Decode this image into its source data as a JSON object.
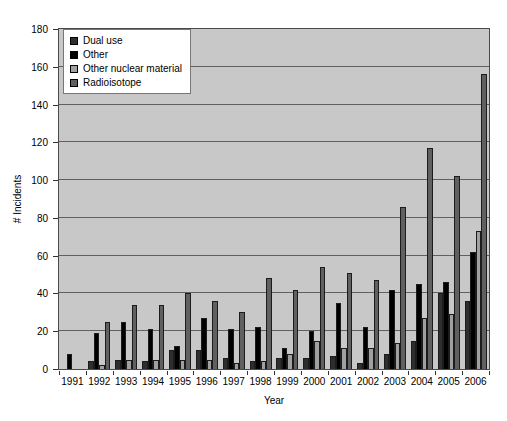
{
  "figure": {
    "background": "#ffffff",
    "plot_background": "#c8c8c8",
    "gridline_color": "#606060"
  },
  "chart_data": {
    "type": "bar",
    "title": "",
    "xlabel": "Year",
    "ylabel": "# Incidents",
    "ylim": [
      0,
      180
    ],
    "ytick_step": 20,
    "yticks": [
      0,
      20,
      40,
      60,
      80,
      100,
      120,
      140,
      160,
      180
    ],
    "grid": true,
    "legend_position": "top-left",
    "categories": [
      "1991",
      "1992",
      "1993",
      "1994",
      "1995",
      "1996",
      "1997",
      "1998",
      "1999",
      "2000",
      "2001",
      "2002",
      "2003",
      "2004",
      "2005",
      "2006"
    ],
    "series": [
      {
        "name": "Dual use",
        "color": "#2e2e2e",
        "values": [
          0,
          4,
          5,
          4,
          10,
          10,
          6,
          4,
          6,
          6,
          7,
          3,
          8,
          15,
          40,
          36
        ]
      },
      {
        "name": "Other",
        "color": "#000000",
        "values": [
          8,
          19,
          25,
          21,
          12,
          27,
          21,
          22,
          11,
          20,
          35,
          22,
          42,
          45,
          46,
          62
        ]
      },
      {
        "name": "Other nuclear material",
        "color": "#a0a0a0",
        "values": [
          0,
          2,
          5,
          5,
          5,
          5,
          3,
          4,
          8,
          15,
          11,
          11,
          14,
          27,
          29,
          73
        ]
      },
      {
        "name": "Radioisotope",
        "color": "#606060",
        "values": [
          0,
          25,
          34,
          34,
          40,
          36,
          30,
          48,
          42,
          54,
          51,
          47,
          86,
          117,
          102,
          156
        ]
      }
    ]
  }
}
